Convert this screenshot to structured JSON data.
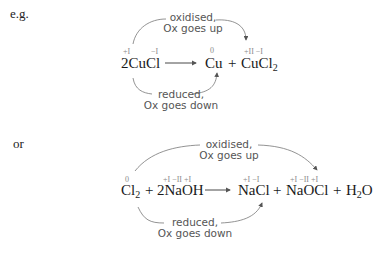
{
  "example1": {
    "intro_label": "e.g.",
    "reactant": "2CuCl",
    "reactant_ox": {
      "cu": "+I",
      "cl": "−I"
    },
    "product1": "Cu",
    "product1_ox": "0",
    "plus": "+",
    "product2_main": "CuCl",
    "product2_sub": "2",
    "product2_ox": "+II −I",
    "oxidised_note": {
      "line1": "oxidised,",
      "line2": "Ox goes up"
    },
    "reduced_note": {
      "line1": "reduced,",
      "line2": "Ox goes down"
    }
  },
  "example2": {
    "intro_label": "or",
    "reactant1_main": "Cl",
    "reactant1_sub": "2",
    "reactant1_ox": "0",
    "plus1": "+",
    "reactant2": "2NaOH",
    "reactant2_ox": "+I −II +I",
    "product1": "NaCl",
    "product1_ox": "+I −I",
    "plus2": "+",
    "product2": "NaOCl",
    "product2_ox": "+I −II +I",
    "plus3": "+",
    "product3_main": "H",
    "product3_sub": "2",
    "product3_tail": "O",
    "oxidised_note": {
      "line1": "oxidised,",
      "line2": "Ox goes up"
    },
    "reduced_note": {
      "line1": "reduced,",
      "line2": "Ox goes down"
    }
  },
  "colors": {
    "arrow": "#6a6a6a",
    "ox_numbers": "#8a8a8a",
    "text": "#1a1a1a"
  }
}
